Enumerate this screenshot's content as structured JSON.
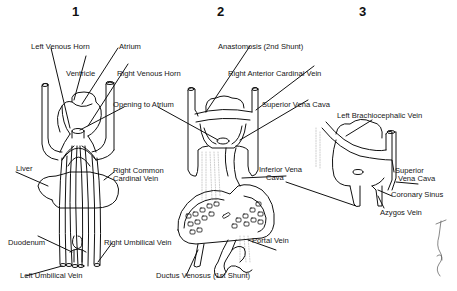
{
  "panels": [
    {
      "number": "1",
      "labels": {
        "left_venous_horn": "Left Venous Horn",
        "atrium": "Atrium",
        "ventricle": "Ventricle",
        "right_venous_horn": "Right Venous Horn",
        "opening_to_atrium": "Opening to Atrium",
        "liver": "Liver",
        "right_common_cardinal_vein_1": "Right Common",
        "right_common_cardinal_vein_2": "Cardinal Vein",
        "duodenum": "Duodenum",
        "right_umbilical_vein": "Right Umbilical Vein",
        "left_umbilical_vein": "Left Umbilical Vein"
      }
    },
    {
      "number": "2",
      "labels": {
        "anastomosis": "Anastomosis (2nd Shunt)",
        "right_anterior_cardinal_vein": "Right Anterior Cardinal Vein",
        "superior_vena_cava": "Superior Vena Cava",
        "inferior_vena_cava_1": "Inferior Vena",
        "inferior_vena_cava_2": "Cava",
        "portal_vein": "Portal Vein",
        "ductus_venosus": "Ductus Venosus (1st Shunt)"
      }
    },
    {
      "number": "3",
      "labels": {
        "left_brachiocephalic_vein": "Left Brachiocephalic Vein",
        "superior_vena_cava_1": "Superior",
        "superior_vena_cava_2": "Vena Cava",
        "coronary_sinus": "Coronary Sinus",
        "azygos_vein": "Azygos Vein"
      }
    }
  ]
}
